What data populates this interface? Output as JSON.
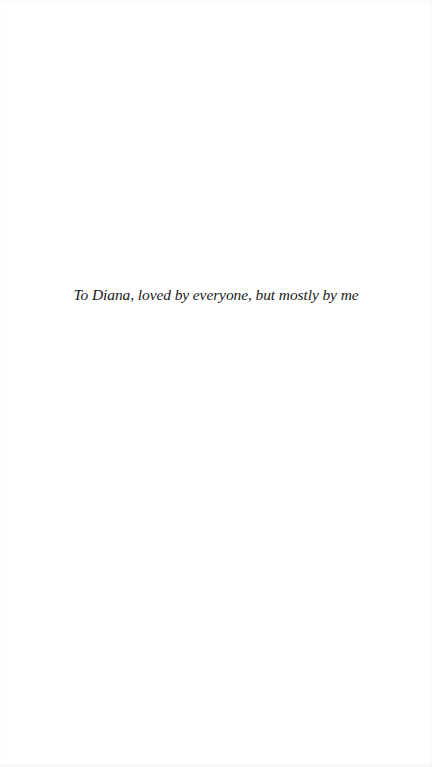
{
  "page": {
    "type": "dedication",
    "dedication_text": "To Diana, loved by everyone, but mostly by me"
  }
}
